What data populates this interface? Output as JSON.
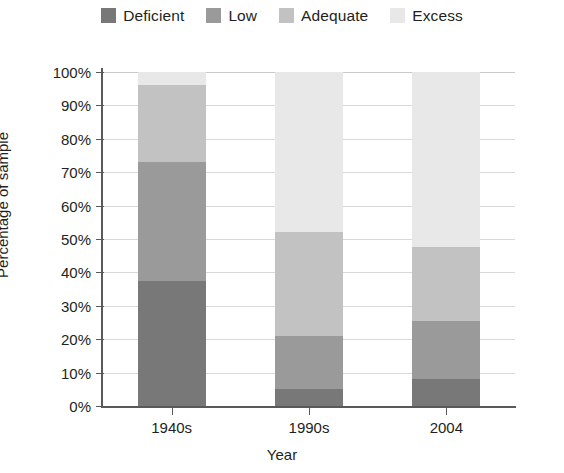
{
  "chart_data": {
    "type": "bar",
    "subtype": "stacked-bar-100-percent",
    "title": "",
    "xlabel": "Year",
    "ylabel": "Percentage of sample",
    "categories": [
      "1940s",
      "1990s",
      "2004"
    ],
    "ylim": [
      0,
      100
    ],
    "ytick_labels": [
      "0%",
      "10%",
      "20%",
      "30%",
      "40%",
      "50%",
      "60%",
      "70%",
      "80%",
      "90%",
      "100%"
    ],
    "ytick_values": [
      0,
      10,
      20,
      30,
      40,
      50,
      60,
      70,
      80,
      90,
      100
    ],
    "grid": true,
    "grid_axis": "y",
    "legend_position": "top-center",
    "stack_order": "bottom-to-top",
    "series": [
      {
        "name": "Deficient",
        "color": "#787878",
        "values": [
          37.5,
          5.0,
          8.0
        ]
      },
      {
        "name": "Low",
        "color": "#9a9a9a",
        "values": [
          35.5,
          16.0,
          17.5
        ]
      },
      {
        "name": "Adequate",
        "color": "#c2c2c2",
        "values": [
          23.0,
          31.0,
          22.0
        ]
      },
      {
        "name": "Excess",
        "color": "#e8e8e8",
        "values": [
          4.0,
          48.0,
          52.5
        ]
      }
    ],
    "cumulative_tops": {
      "1940s": {
        "Deficient": 37.5,
        "Low": 73.0,
        "Adequate": 96.0,
        "Excess": 100.0
      },
      "1990s": {
        "Deficient": 5.0,
        "Low": 21.0,
        "Adequate": 52.0,
        "Excess": 100.0
      },
      "2004": {
        "Deficient": 8.0,
        "Low": 25.5,
        "Adequate": 47.5,
        "Excess": 100.0
      }
    }
  },
  "legend": {
    "items": [
      {
        "label": "Deficient"
      },
      {
        "label": "Low"
      },
      {
        "label": "Adequate"
      },
      {
        "label": "Excess"
      }
    ]
  },
  "axes": {
    "y_title": "Percentage of sample",
    "x_title": "Year"
  }
}
